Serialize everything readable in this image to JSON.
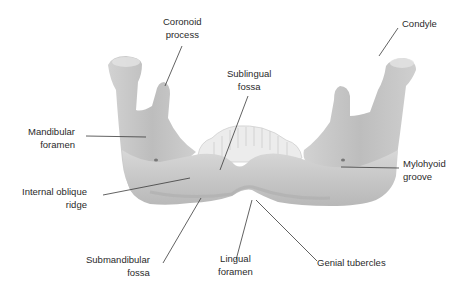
{
  "diagram": {
    "colors": {
      "bone": "#c9c9c9",
      "bone_shadow": "#a9a9a9",
      "bone_highlight": "#e2e2e2",
      "teeth": "#ededed",
      "leader_line": "#3a3a3a",
      "text": "#2a2a2a"
    },
    "labels": {
      "coronoid_process": "Coronoid\nprocess",
      "condyle": "Condyle",
      "sublingual_fossa": "Sublingual\nfossa",
      "mandibular_foramen": "Mandibular\nforamen",
      "mylohyoid_groove": "Mylohyoid\ngroove",
      "internal_oblique_ridge": "Internal oblique\nridge",
      "submandibular_fossa": "Submandibular\nfossa",
      "lingual_foramen": "Lingual\nforamen",
      "genial_tubercles": "Genial tubercles"
    }
  }
}
